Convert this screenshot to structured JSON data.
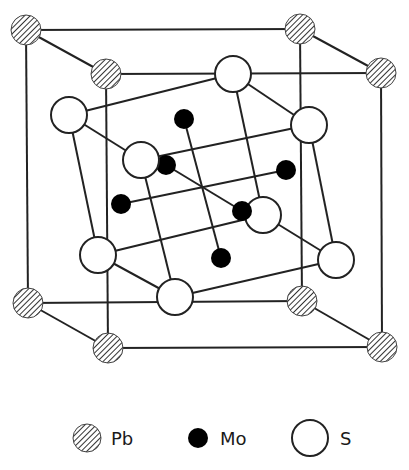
{
  "colors": {
    "line": "#222222",
    "pb_fill_bg": "#ffffff",
    "pb_hatch": "#333333",
    "mo_fill": "#000000",
    "s_fill": "#ffffff"
  },
  "legend": {
    "items": [
      {
        "symbol": "hatched-circle",
        "label": "Pb"
      },
      {
        "symbol": "filled-circle",
        "label": "Mo"
      },
      {
        "symbol": "open-circle",
        "label": "S"
      }
    ]
  },
  "atoms": {
    "Pb": [
      {
        "id": "pb-tl-back",
        "x": 26,
        "y": 30
      },
      {
        "id": "pb-tr-back",
        "x": 300,
        "y": 29
      },
      {
        "id": "pb-bl-back",
        "x": 28,
        "y": 303
      },
      {
        "id": "pb-br-back",
        "x": 302,
        "y": 301
      },
      {
        "id": "pb-tl-front",
        "x": 106,
        "y": 74
      },
      {
        "id": "pb-tr-front",
        "x": 381,
        "y": 73
      },
      {
        "id": "pb-bl-front",
        "x": 108,
        "y": 348
      },
      {
        "id": "pb-br-front",
        "x": 382,
        "y": 347
      }
    ],
    "S": [
      {
        "id": "s1",
        "x": 233,
        "y": 74
      },
      {
        "id": "s2",
        "x": 69,
        "y": 115
      },
      {
        "id": "s3",
        "x": 309,
        "y": 125
      },
      {
        "id": "s4",
        "x": 141,
        "y": 160
      },
      {
        "id": "s5",
        "x": 263,
        "y": 215
      },
      {
        "id": "s6",
        "x": 98,
        "y": 255
      },
      {
        "id": "s7",
        "x": 336,
        "y": 260
      },
      {
        "id": "s8",
        "x": 175,
        "y": 297
      }
    ],
    "Mo": [
      {
        "id": "mo1",
        "x": 184,
        "y": 119
      },
      {
        "id": "mo2",
        "x": 166,
        "y": 165
      },
      {
        "id": "mo3",
        "x": 286,
        "y": 170
      },
      {
        "id": "mo4",
        "x": 121,
        "y": 204
      },
      {
        "id": "mo5",
        "x": 242,
        "y": 211
      },
      {
        "id": "mo6",
        "x": 221,
        "y": 258
      }
    ]
  }
}
